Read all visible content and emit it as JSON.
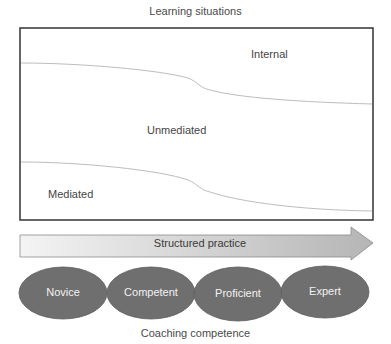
{
  "title": "Learning situations",
  "regions": {
    "internal": "Internal",
    "unmediated": "Unmediated",
    "mediated": "Mediated"
  },
  "arrow": {
    "label": "Structured practice"
  },
  "stages": [
    {
      "label": "Novice"
    },
    {
      "label": "Competent"
    },
    {
      "label": "Proficient"
    },
    {
      "label": "Expert"
    }
  ],
  "footer": "Coaching competence",
  "colors": {
    "ellipse_fill": "#6f6f6f",
    "box_border": "#333333",
    "curve": "#bbbbbb",
    "arrow_fill_start": "#f2f2f2",
    "arrow_fill_end": "#b8b8b8"
  }
}
